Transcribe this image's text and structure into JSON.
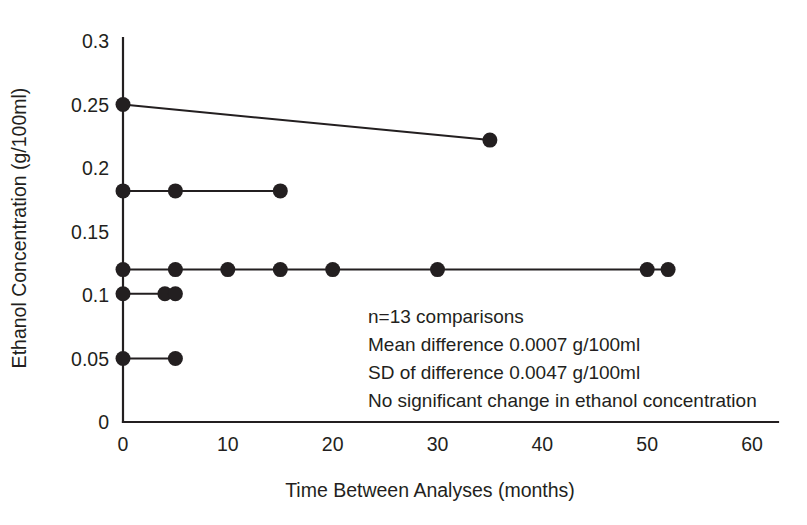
{
  "chart_data": {
    "type": "scatter",
    "title": "",
    "xlabel": "Time Between Analyses (months)",
    "ylabel": "Ethanol Concentration (g/100ml)",
    "xlim": [
      0,
      60
    ],
    "ylim": [
      0,
      0.3
    ],
    "xticks": [
      "0",
      "10",
      "20",
      "30",
      "40",
      "50",
      "60"
    ],
    "xtick_values": [
      0,
      10,
      20,
      30,
      40,
      50,
      60
    ],
    "yticks": [
      "0",
      "0.05",
      "0.1",
      "0.15",
      "0.2",
      "0.25",
      "0.3"
    ],
    "ytick_values": [
      0,
      0.05,
      0.1,
      0.15,
      0.2,
      0.25,
      0.3
    ],
    "grid": false,
    "legend": "none",
    "marker": "filled-circle",
    "series": [
      {
        "name": "case-1",
        "x": [
          0,
          35
        ],
        "y": [
          0.25,
          0.222
        ]
      },
      {
        "name": "case-2",
        "x": [
          0,
          5,
          15
        ],
        "y": [
          0.182,
          0.182,
          0.182
        ]
      },
      {
        "name": "case-3",
        "x": [
          0,
          5,
          10,
          15,
          20,
          30,
          50,
          52
        ],
        "y": [
          0.12,
          0.12,
          0.12,
          0.12,
          0.12,
          0.12,
          0.12,
          0.12
        ]
      },
      {
        "name": "case-4",
        "x": [
          0,
          4,
          5
        ],
        "y": [
          0.101,
          0.101,
          0.101
        ]
      },
      {
        "name": "case-5",
        "x": [
          0,
          5
        ],
        "y": [
          0.05,
          0.05
        ]
      }
    ],
    "annotations": [
      "n=13 comparisons",
      "Mean difference 0.0007 g/100ml",
      "SD of difference 0.0047 g/100ml",
      "No significant change in ethanol concentration"
    ],
    "colors": {
      "ink": "#231f20",
      "background": "#ffffff"
    }
  }
}
